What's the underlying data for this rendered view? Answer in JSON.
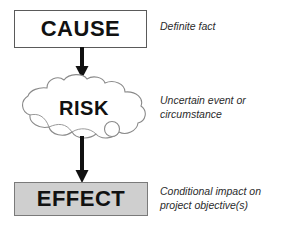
{
  "diagram": {
    "nodes": [
      {
        "id": "cause",
        "label": "CAUSE",
        "shape": "rectangle",
        "fill": "#ffffff",
        "stroke": "#5a5a5a",
        "annotation": "Definite fact"
      },
      {
        "id": "risk",
        "label": "RISK",
        "shape": "cloud",
        "fill": "#ffffff",
        "stroke": "#8a8a8a",
        "annotation": "Uncertain event or\ncircumstance"
      },
      {
        "id": "effect",
        "label": "EFFECT",
        "shape": "rectangle",
        "fill": "#cfcfcf",
        "stroke": "#7a7a7a",
        "annotation": "Conditional impact on\nproject objective(s)"
      }
    ],
    "connectors": [
      {
        "id": "cause-to-risk",
        "from": "cause",
        "to": "risk",
        "style": "solid-arrow-down",
        "color": "#111111"
      },
      {
        "id": "risk-to-effect",
        "from": "risk",
        "to": "effect",
        "style": "solid-arrow-down",
        "color": "#111111"
      }
    ],
    "icons": {
      "cloud": "cloud-shape-icon",
      "arrow": "arrow-down-icon",
      "bubble": "small-cloud-bubble-icon"
    }
  }
}
